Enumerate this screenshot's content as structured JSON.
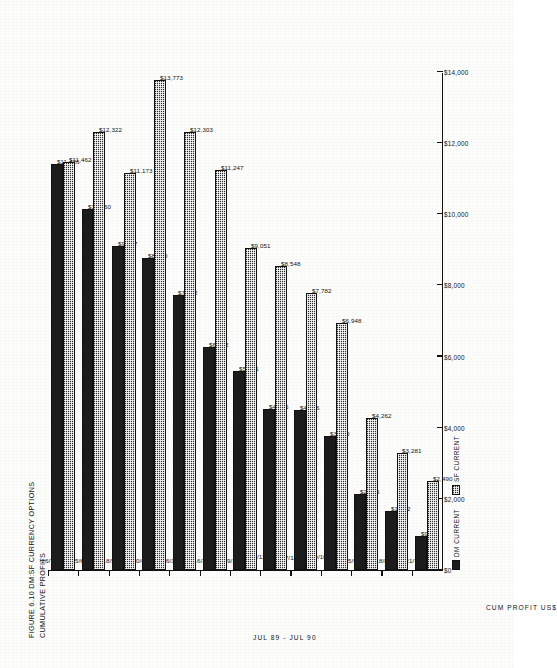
{
  "figure": {
    "title_line1": "FIGURE 6.10 DM:SF CURRENCY OPTIONS",
    "title_line2": "CUMULATIVE PROFITS"
  },
  "legend": {
    "position": "bottom-left",
    "items": [
      {
        "key": "dm",
        "label": "DM CURRENT",
        "color": "#1c1c1c",
        "fill": "solid"
      },
      {
        "key": "sf",
        "label": "SF CURRENT",
        "color": "#2b2b2b",
        "fill": "cross-hatch"
      }
    ]
  },
  "chart_data": {
    "type": "bar",
    "orientation": "horizontal",
    "title": "FIGURE 6.10 DM:SF CURRENCY OPTIONS CUMULATIVE PROFITS",
    "xlabel": "CUM PROFIT US$",
    "ylabel": "JUL 89 - JUL 90",
    "xlim": [
      0,
      14000
    ],
    "grid": false,
    "xticks": [
      0,
      2000,
      4000,
      6000,
      8000,
      10000,
      12000,
      14000
    ],
    "xticklabels": [
      "$0",
      "$2,000",
      "$4,000",
      "$6,000",
      "$8,000",
      "$10,000",
      "$12,000",
      "$14,000"
    ],
    "categories": [
      "21/7/89",
      "18/8/89",
      "15/9/89",
      "20/10/89",
      "17/11/89",
      "15/12/89",
      "19/1/90",
      "16/2/90",
      "16/3/90",
      "20/4/90",
      "18/5/90",
      "15/6/90",
      "26/7/90"
    ],
    "series": [
      {
        "name": "DM CURRENT",
        "key": "dm",
        "color": "#1c1c1c",
        "values": [
          956,
          1662,
          2146,
          3770,
          4496,
          4526,
          5596,
          6272,
          7722,
          8770,
          9107,
          10160,
          11426
        ],
        "labels": [
          "$956",
          "$1,662",
          "$2,146",
          "$3,770",
          "$4,496",
          "$4,526",
          "$5,596",
          "$6,272",
          "$7,722",
          "$8,770",
          "$9,107",
          "$10,160",
          "$11,426"
        ]
      },
      {
        "name": "SF CURRENT",
        "key": "sf",
        "color": "#2b2b2b",
        "values": [
          2490,
          3281,
          4262,
          6948,
          7782,
          8548,
          9051,
          11247,
          12303,
          13773,
          11173,
          12322,
          11462
        ],
        "labels": [
          "$2,490",
          "$3,281",
          "$4,262",
          "$6,948",
          "$7,782",
          "$8,548",
          "$9,051",
          "$11,247",
          "$12,303",
          "$13,773",
          "$11,173",
          "$12,322",
          "$11,462"
        ]
      }
    ]
  }
}
